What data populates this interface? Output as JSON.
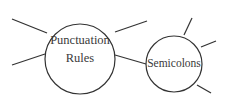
{
  "diagram": {
    "type": "mind-map",
    "colors": {
      "stroke": "#333333",
      "text": "#3a3a3a",
      "background": "#ffffff"
    },
    "nodes": [
      {
        "id": "punctuation-rules",
        "label_line1": "Punctuation",
        "label_line2": "Rules"
      },
      {
        "id": "semicolons",
        "label": "Semicolons"
      }
    ],
    "edges": [
      {
        "from": "punctuation-rules",
        "to": "semicolons"
      }
    ],
    "empty_branches": {
      "punctuation-rules": 3,
      "semicolons": 3
    }
  }
}
